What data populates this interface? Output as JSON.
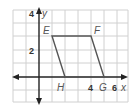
{
  "diagram": {
    "type": "coordinate-plane",
    "shape": "parallelogram",
    "axes": {
      "x_label": "x",
      "y_label": "y",
      "x_tick_labels": [
        "4",
        "6"
      ],
      "y_tick_labels": [
        "4",
        "2"
      ]
    },
    "vertices": [
      {
        "name": "E",
        "x": 1,
        "y": 3
      },
      {
        "name": "F",
        "x": 4,
        "y": 3
      },
      {
        "name": "G",
        "x": 5,
        "y": 0
      },
      {
        "name": "H",
        "x": 2,
        "y": 0
      }
    ],
    "grid": {
      "x_min": -2,
      "x_max": 7,
      "y_min": -2,
      "y_max": 5
    },
    "colors": {
      "grid": "#d0d0d0",
      "axis": "#222222",
      "shape": "#555555",
      "label": "#555555"
    }
  }
}
